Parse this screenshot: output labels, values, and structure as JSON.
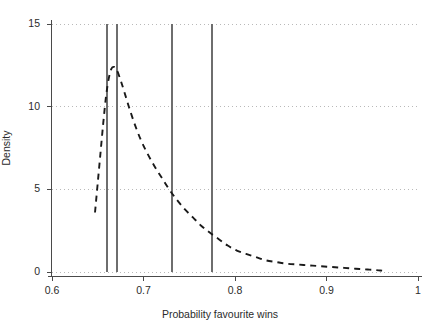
{
  "chart_data": {
    "type": "line",
    "title": "",
    "subtitle": "",
    "xlabel": "Probability favourite wins",
    "ylabel": "Density",
    "xlim": [
      0.6,
      1.0
    ],
    "ylim": [
      0.0,
      15.0
    ],
    "xticks": [
      0.6,
      0.7,
      0.8,
      0.9,
      1.0
    ],
    "xtick_labels": [
      "0.6",
      "0.7",
      "0.8",
      "0.9",
      "1"
    ],
    "yticks": [
      0,
      5,
      10,
      15
    ],
    "ytick_labels": [
      "0",
      "5",
      "10",
      "15"
    ],
    "grid": "horizontal-dotted",
    "legend": null,
    "series": [
      {
        "name": "Kernel density of probability favourite wins",
        "style": "dashed",
        "color": "#1a1a1a",
        "x": [
          0.647,
          0.65,
          0.653,
          0.656,
          0.659,
          0.662,
          0.665,
          0.668,
          0.671,
          0.675,
          0.679,
          0.684,
          0.69,
          0.697,
          0.704,
          0.712,
          0.72,
          0.728,
          0.736,
          0.745,
          0.754,
          0.763,
          0.772,
          0.782,
          0.792,
          0.802,
          0.812,
          0.823,
          0.834,
          0.845,
          0.857,
          0.869,
          0.881,
          0.893,
          0.906,
          0.919,
          0.932,
          0.945,
          0.957,
          0.966
        ],
        "y": [
          3.6,
          5.4,
          7.2,
          9.0,
          10.6,
          11.7,
          12.3,
          12.4,
          12.2,
          11.6,
          10.9,
          10.0,
          9.0,
          8.0,
          7.2,
          6.4,
          5.7,
          5.0,
          4.4,
          3.8,
          3.3,
          2.8,
          2.4,
          2.0,
          1.6,
          1.3,
          1.1,
          0.9,
          0.7,
          0.6,
          0.5,
          0.45,
          0.4,
          0.35,
          0.3,
          0.25,
          0.2,
          0.15,
          0.1,
          0.05
        ]
      }
    ],
    "reference_lines": [
      {
        "name": "reference-line-1",
        "x": 0.66,
        "orientation": "vertical",
        "color": "#6e6e6e"
      },
      {
        "name": "reference-line-2",
        "x": 0.671,
        "orientation": "vertical",
        "color": "#6e6e6e"
      },
      {
        "name": "reference-line-3",
        "x": 0.731,
        "orientation": "vertical",
        "color": "#6e6e6e"
      },
      {
        "name": "reference-line-4",
        "x": 0.775,
        "orientation": "vertical",
        "color": "#6e6e6e"
      }
    ],
    "annotations": []
  },
  "axes": {
    "y_title": "Density",
    "x_title": "Probability favourite wins"
  }
}
